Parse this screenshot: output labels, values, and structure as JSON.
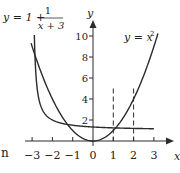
{
  "chart_data": {
    "type": "line",
    "title": "",
    "xlabel": "x",
    "ylabel": "y",
    "xlim": [
      -3.2,
      3.8
    ],
    "ylim": [
      0,
      11.5
    ],
    "grid": false,
    "x_ticks": [
      -3,
      -2,
      -1,
      0,
      1,
      2,
      3
    ],
    "x_tick_labels": [
      "−3",
      "−2",
      "−1",
      "0",
      "1",
      "2",
      "3"
    ],
    "y_ticks": [
      2,
      4,
      6,
      8,
      10
    ],
    "y_tick_labels": [
      "2",
      "4",
      "6",
      "8",
      "10"
    ],
    "series": [
      {
        "name": "y = x^2",
        "label_display": "y = x²",
        "x": [
          -3.05,
          -2.5,
          -2,
          -1.5,
          -1,
          -0.5,
          0,
          0.5,
          1,
          1.5,
          2,
          2.5,
          3,
          3.2
        ],
        "values": [
          9.3,
          6.25,
          4,
          2.25,
          1,
          0.25,
          0,
          0.25,
          1,
          2.25,
          4,
          6.25,
          9,
          10.24
        ]
      },
      {
        "name": "y = 1 + 1/(x+3)",
        "label_display": "y = 1 + 1/(x + 3)",
        "x": [
          -2.89,
          -2.8,
          -2.6,
          -2.4,
          -2.0,
          -1.5,
          -1,
          0,
          1,
          2,
          3
        ],
        "values": [
          10.1,
          6.0,
          3.5,
          2.67,
          2.0,
          1.67,
          1.5,
          1.33,
          1.25,
          1.2,
          1.17
        ]
      }
    ],
    "annotations": [
      {
        "type": "vline-dashed",
        "x": 1,
        "y_from": 0,
        "y_to": 5
      },
      {
        "type": "vline-dashed",
        "x": 2,
        "y_from": 0,
        "y_to": 5
      }
    ],
    "equation_labels": {
      "hyperbola": {
        "lhs": "y = 1 +",
        "num": "1",
        "den": "x + 3"
      },
      "parabola": {
        "text": "y = x",
        "sup": "2"
      }
    },
    "axis_labels": {
      "x": "x",
      "y": "y"
    },
    "stray_text": "n"
  }
}
